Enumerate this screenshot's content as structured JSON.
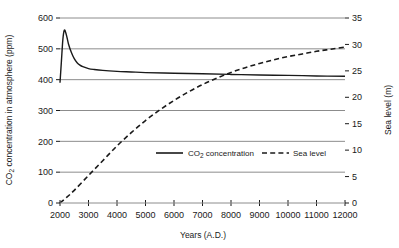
{
  "chart_data": {
    "type": "line",
    "title": "",
    "xlabel": "Years (A.D.)",
    "ylabel": "CO2 concentration in atmosphere (ppm)",
    "y2label": "Sea level (m)",
    "xlim": [
      2000,
      12000
    ],
    "ylim": [
      0,
      600
    ],
    "y2lim": [
      0,
      35
    ],
    "grid": true,
    "legend_position": "inside-center",
    "xticks": [
      2000,
      3000,
      4000,
      5000,
      6000,
      7000,
      8000,
      9000,
      10000,
      11000,
      12000
    ],
    "xtick_labels": [
      "2000",
      "3000",
      "4000",
      "5000",
      "6000",
      "7000",
      "8000",
      "9000",
      "10000",
      "11000",
      "12000"
    ],
    "yticks": [
      0,
      100,
      200,
      300,
      400,
      500,
      600
    ],
    "ytick_labels": [
      "0",
      "100",
      "200",
      "300",
      "400",
      "500",
      "600"
    ],
    "y2ticks": [
      0,
      5,
      10,
      15,
      20,
      25,
      30,
      35
    ],
    "y2tick_labels": [
      "0",
      "5",
      "10",
      "15",
      "20",
      "25",
      "30",
      "35"
    ],
    "series": [
      {
        "name": "CO2 concentration",
        "legend_label_main": "CO",
        "legend_label_sub": "2",
        "legend_label_rest": " concentration",
        "axis": "left",
        "style": "solid",
        "color": "#1a1a1a",
        "x": [
          2000,
          2050,
          2100,
          2150,
          2200,
          2250,
          2300,
          2400,
          2500,
          2600,
          2700,
          2800,
          3000,
          3200,
          3500,
          4000,
          4500,
          5000,
          6000,
          7000,
          8000,
          9000,
          10000,
          11000,
          12000
        ],
        "values": [
          390,
          460,
          530,
          560,
          553,
          535,
          515,
          488,
          468,
          455,
          447,
          442,
          436,
          433,
          430,
          427,
          425,
          423,
          421,
          419,
          417,
          415,
          414,
          412,
          411
        ]
      },
      {
        "name": "Sea level",
        "legend_label_main": "Sea level",
        "axis": "right",
        "style": "dashed",
        "color": "#1a1a1a",
        "x": [
          2000,
          2200,
          2500,
          3000,
          3500,
          4000,
          4500,
          5000,
          5500,
          6000,
          6500,
          7000,
          7500,
          8000,
          8500,
          9000,
          9500,
          10000,
          10500,
          11000,
          11500,
          12000
        ],
        "values": [
          0,
          0.9,
          2.4,
          5.2,
          8.0,
          10.8,
          13.3,
          15.6,
          17.6,
          19.4,
          21.0,
          22.4,
          23.6,
          24.7,
          25.6,
          26.4,
          27.1,
          27.7,
          28.2,
          28.7,
          29.1,
          29.5
        ]
      }
    ],
    "colors": {
      "grid": "#8c8c8c",
      "axis": "#1a1a1a",
      "text": "#1a1a1a",
      "background": "#ffffff"
    }
  }
}
